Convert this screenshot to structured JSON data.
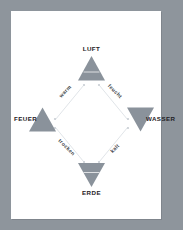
{
  "page": {
    "background_color": "#8e959c",
    "sheet_color": "#ffffff",
    "symbol_color": "#8a929b",
    "line_color": "#d9dde1",
    "text_color": "#1d2024"
  },
  "diagram": {
    "type": "four-elements-diagram",
    "elements": [
      {
        "id": "luft",
        "label": "LUFT",
        "position": "top",
        "symbol": "triangle-up-barred",
        "symbol_name": "air-symbol"
      },
      {
        "id": "wasser",
        "label": "WASSER",
        "position": "right",
        "symbol": "triangle-down",
        "symbol_name": "water-symbol"
      },
      {
        "id": "erde",
        "label": "ERDE",
        "position": "bottom",
        "symbol": "triangle-down-barred",
        "symbol_name": "earth-symbol"
      },
      {
        "id": "feuer",
        "label": "FEUER",
        "position": "left",
        "symbol": "triangle-up",
        "symbol_name": "fire-symbol"
      }
    ],
    "qualities": [
      {
        "id": "warm",
        "label": "warm",
        "edge": "feuer-luft",
        "rotation": -45
      },
      {
        "id": "feucht",
        "label": "feucht",
        "edge": "luft-wasser",
        "rotation": 45
      },
      {
        "id": "kalt",
        "label": "kalt",
        "edge": "wasser-erde",
        "rotation": -45
      },
      {
        "id": "trocken",
        "label": "trocken",
        "edge": "erde-feuer",
        "rotation": 45
      }
    ]
  }
}
